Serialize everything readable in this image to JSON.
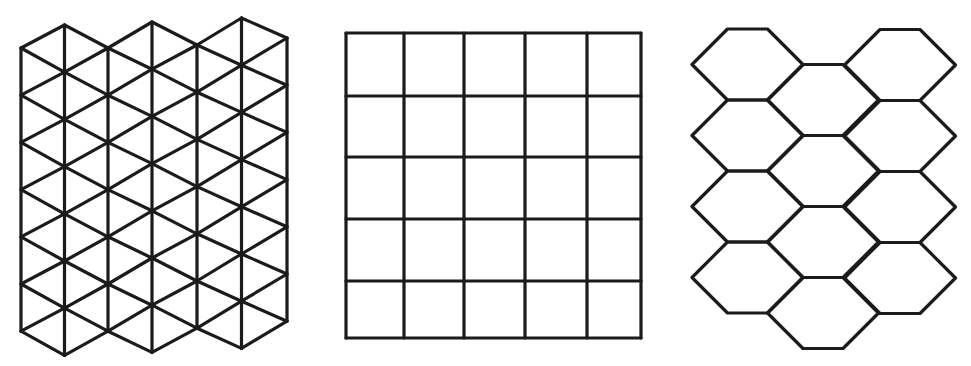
{
  "canvas": {
    "width": 971,
    "height": 366,
    "background": "#ffffff"
  },
  "style": {
    "stroke_color": "#1b1b1b",
    "stroke_width": 3.2
  },
  "panels": [
    {
      "id": "triangle-tiling",
      "label": "Triangular tessellation",
      "type": "triangle",
      "columns_x": [
        21,
        64.5,
        108,
        152,
        197,
        241.5,
        287
      ],
      "even_column_top_y": [
        48,
        null,
        48,
        null,
        45,
        null,
        38
      ],
      "odd_column_top_y": [
        null,
        25,
        null,
        22,
        null,
        18,
        null
      ],
      "row_pitch": 47.2,
      "even_column_vertex_count": 7,
      "odd_column_vertex_count": 8
    },
    {
      "id": "square-tiling",
      "label": "Square tessellation",
      "type": "square",
      "columns_x": [
        346,
        404,
        464,
        525,
        587,
        641
      ],
      "rows_y": [
        33,
        96,
        157,
        219,
        281,
        338
      ],
      "cells": "5x5"
    },
    {
      "id": "hexagon-tiling",
      "label": "Hexagonal tessellation",
      "type": "hexagon",
      "hex_half_width": 55.5,
      "hex_top_half_width": 20,
      "hex_half_height": 35.5,
      "columns": [
        {
          "center_x": 747.5,
          "centers_y": [
            64.5,
            135.5,
            206.5,
            277.5
          ]
        },
        {
          "center_x": 823,
          "centers_y": [
            100,
            171,
            242,
            313
          ]
        },
        {
          "center_x": 900,
          "centers_y": [
            65,
            136,
            207,
            278
          ]
        }
      ]
    }
  ]
}
